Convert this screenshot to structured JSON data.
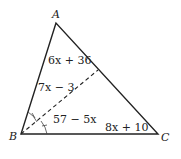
{
  "diagram": {
    "type": "triangle-angle-bisector",
    "vertices": [
      {
        "label": "A",
        "x": 56,
        "y": 23
      },
      {
        "label": "B",
        "x": 21,
        "y": 134
      },
      {
        "label": "C",
        "x": 158,
        "y": 134
      }
    ],
    "bisector": {
      "from": "B",
      "to_point_on": "AC",
      "style": "dashed"
    },
    "labels": {
      "angle_ABD": "7x − 3",
      "angle_A": "6x + 36",
      "angle_DBC": "57 − 5x",
      "angle_C": "8x + 10"
    },
    "colors": {
      "stroke": "#222222",
      "background": "#ffffff"
    }
  }
}
